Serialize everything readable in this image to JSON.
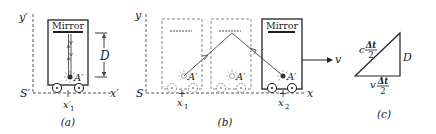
{
  "panel_a": {
    "axis_y": "y′",
    "axis_x": "x′",
    "origin": "S′",
    "mirror_label": "Mirror",
    "distance_label": "D",
    "source_label": "A′",
    "position_label": "x′",
    "position_sub": "1",
    "caption": "(a)"
  },
  "panel_b": {
    "axis_y": "y",
    "axis_x": "x",
    "origin": "S",
    "mirror_label": "Mirror",
    "source_label": "A′",
    "pos1_label": "x",
    "pos1_sub": "1",
    "pos2_label": "x",
    "pos2_sub": "2",
    "velocity_label": "v",
    "caption": "(b)"
  },
  "panel_c": {
    "hyp_coef": "c",
    "hyp_num": "Δt",
    "hyp_den": "2",
    "base_coef": "v",
    "base_num": "Δt",
    "base_den": "2",
    "side_label": "D",
    "caption": "(c)"
  },
  "colors": {
    "ink": "#222222",
    "dashed": "#555555",
    "ghost": "#888888"
  }
}
